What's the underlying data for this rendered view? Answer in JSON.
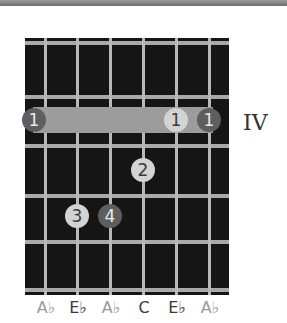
{
  "chord": {
    "fret_position_label": "IV",
    "strings": [
      {
        "note": "Ab",
        "label": "A♭",
        "is_root": true,
        "x": 45
      },
      {
        "note": "Eb",
        "label": "E♭",
        "is_root": false,
        "x": 77
      },
      {
        "note": "Ab",
        "label": "A♭",
        "is_root": true,
        "x": 110
      },
      {
        "note": "C",
        "label": "C",
        "is_root": false,
        "x": 143
      },
      {
        "note": "Eb",
        "label": "E♭",
        "is_root": false,
        "x": 176
      },
      {
        "note": "Ab",
        "label": "A♭",
        "is_root": true,
        "x": 209
      }
    ],
    "barre": {
      "finger": "1",
      "from_string": 1,
      "to_string": 6,
      "fret": 1
    },
    "fingers": [
      {
        "finger": "1",
        "string": 1,
        "fret": 1,
        "is_root": true
      },
      {
        "finger": "1",
        "string": 5,
        "fret": 1,
        "is_root": false
      },
      {
        "finger": "1",
        "string": 6,
        "fret": 1,
        "is_root": true
      },
      {
        "finger": "2",
        "string": 4,
        "fret": 2,
        "is_root": false
      },
      {
        "finger": "3",
        "string": 2,
        "fret": 3,
        "is_root": false
      },
      {
        "finger": "4",
        "string": 3,
        "fret": 3,
        "is_root": true
      }
    ]
  }
}
